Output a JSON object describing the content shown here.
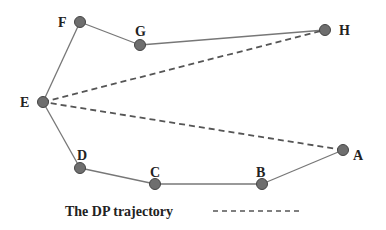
{
  "diagram": {
    "colors": {
      "solid_line": "#777777",
      "dashed_line": "#555555",
      "node_fill": "#6e6e6e",
      "node_stroke": "#444444",
      "label": "#222222"
    },
    "nodes": [
      {
        "id": "A",
        "x": 343,
        "y": 150,
        "lx": 353,
        "ly": 160
      },
      {
        "id": "B",
        "x": 262,
        "y": 184,
        "lx": 256,
        "ly": 177
      },
      {
        "id": "C",
        "x": 155,
        "y": 184,
        "lx": 150,
        "ly": 177
      },
      {
        "id": "D",
        "x": 80,
        "y": 168,
        "lx": 77,
        "ly": 160
      },
      {
        "id": "E",
        "x": 43,
        "y": 102,
        "lx": 20,
        "ly": 107
      },
      {
        "id": "F",
        "x": 80,
        "y": 22,
        "lx": 58,
        "ly": 27
      },
      {
        "id": "G",
        "x": 140,
        "y": 45,
        "lx": 135,
        "ly": 36
      },
      {
        "id": "H",
        "x": 325,
        "y": 30,
        "lx": 339,
        "ly": 35
      }
    ],
    "trajectory": [
      "A",
      "B",
      "C",
      "D",
      "E",
      "F",
      "G",
      "H"
    ],
    "dp_trajectory": [
      "A",
      "E",
      "H"
    ],
    "legend": {
      "label": "The DP trajectory",
      "x": 65,
      "y": 216,
      "line_x1": 213,
      "line_x2": 302,
      "line_y": 211
    }
  }
}
